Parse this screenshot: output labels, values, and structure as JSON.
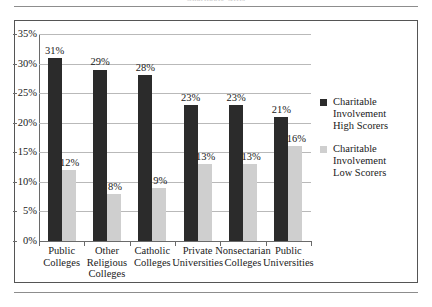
{
  "figure": {
    "title_cut_off": "Charitable Gifts",
    "frame": true
  },
  "chart_data": {
    "type": "bar",
    "title": "Charitable Gifts",
    "xlabel": "",
    "ylabel": "",
    "ylim": [
      0,
      35
    ],
    "ytick_labels": [
      "35%",
      "30%",
      "25%",
      "20%",
      "15%",
      "10%",
      "5%",
      "0%"
    ],
    "ytick_values": [
      35,
      30,
      25,
      20,
      15,
      10,
      5,
      0
    ],
    "grid": true,
    "legend_position": "right",
    "categories": [
      "Public Colleges",
      "Other Religious Colleges",
      "Catholic Colleges",
      "Private Universities",
      "Nonsectarian Colleges",
      "Public Universities"
    ],
    "category_lines": [
      [
        "Public",
        "Colleges"
      ],
      [
        "Other",
        "Religious",
        "Colleges"
      ],
      [
        "Catholic",
        "Colleges"
      ],
      [
        "Private",
        "Universities"
      ],
      [
        "Nonsectarian",
        "Colleges"
      ],
      [
        "Public",
        "Universities"
      ]
    ],
    "series": [
      {
        "name": "Charitable Involvement High Scorers",
        "name_lines": [
          "Charitable",
          "Involvement",
          "High Scorers"
        ],
        "color": "#2b2b2b",
        "values": [
          31,
          29,
          28,
          23,
          23,
          21
        ],
        "labels": [
          "31%",
          "29%",
          "28%",
          "23%",
          "23%",
          "21%"
        ]
      },
      {
        "name": "Charitable Involvement Low Scorers",
        "name_lines": [
          "Charitable",
          "Involvement",
          "Low Scorers"
        ],
        "color": "#cfcfcf",
        "values": [
          12,
          8,
          9,
          13,
          13,
          16
        ],
        "labels": [
          "12%",
          "8%",
          "9%",
          "13%",
          "13%",
          "16%"
        ]
      }
    ]
  },
  "colors": {
    "high_scorers": "#2b2b2b",
    "low_scorers": "#cfcfcf",
    "gridline": "#b9b9b9",
    "axis": "#6a6a6a",
    "frame": "#555555",
    "rule": "#8d8d8d"
  }
}
